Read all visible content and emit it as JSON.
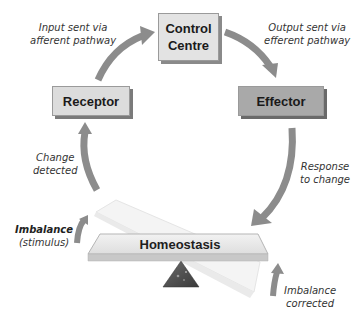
{
  "diagram": {
    "nodes": {
      "control_centre": "Control Centre",
      "control_centre_line1": "Control",
      "control_centre_line2": "Centre",
      "receptor": "Receptor",
      "effector": "Effector",
      "homeostasis": "Homeostasis"
    },
    "edge_labels": {
      "input_line1": "Input sent via",
      "input_line2": "afferent pathway",
      "output_line1": "Output sent via",
      "output_line2": "efferent pathway",
      "change_line1": "Change",
      "change_line2": "detected",
      "response_line1": "Response",
      "response_line2": "to change",
      "imbalance_line1": "Imbalance",
      "imbalance_line2": "(stimulus)",
      "corrected_line1": "Imbalance",
      "corrected_line2": "corrected"
    },
    "edges": [
      {
        "from": "Receptor",
        "to": "Control Centre",
        "label": "Input sent via afferent pathway"
      },
      {
        "from": "Control Centre",
        "to": "Effector",
        "label": "Output sent via efferent pathway"
      },
      {
        "from": "Effector",
        "to": "Homeostasis",
        "label": "Response to change"
      },
      {
        "from": "Homeostasis",
        "to": "Receptor",
        "label": "Change detected"
      }
    ],
    "colors": {
      "arrow": "#8c8c8c",
      "control_box": "#e3e3e3",
      "receptor_box": "#dcdcdc",
      "effector_box": "#a9a9a9",
      "fulcrum": "#4a4a4a"
    }
  }
}
